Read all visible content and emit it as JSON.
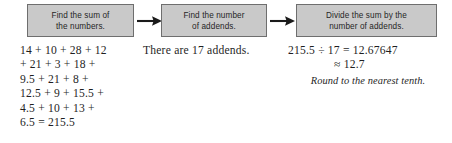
{
  "flow": {
    "steps": [
      {
        "id": "find-sum",
        "text": "Find the sum of\nthe numbers."
      },
      {
        "id": "find-count",
        "text": "Find the number\nof addends."
      },
      {
        "id": "divide",
        "text": "Divide the sum by the\nnumber of addends."
      }
    ],
    "arrows": [
      {
        "id": "arrow-1",
        "glyph": "right-arrow"
      },
      {
        "id": "arrow-2",
        "glyph": "right-arrow"
      }
    ]
  },
  "work": {
    "sum_column": {
      "lines": [
        "14 + 10 + 28 + 12",
        "+ 21 + 3 + 18 +",
        "9.5 + 21 + 8 +",
        "12.5 + 9 + 15.5 +",
        "4.5 + 10 + 13 +",
        "6.5 = 215.5"
      ]
    },
    "count_column": {
      "lines": [
        "There are 17 addends."
      ]
    },
    "divide_column": {
      "equation": "215.5 ÷ 17 = 12.67647",
      "approximation": "≈ 12.7",
      "caption": "Round to the nearest tenth."
    }
  },
  "colors": {
    "box_fill": "#c9c9c9",
    "box_border": "#6e6e6e",
    "text": "#1f1f1f",
    "box_text": "#262626",
    "background": "#ffffff"
  }
}
